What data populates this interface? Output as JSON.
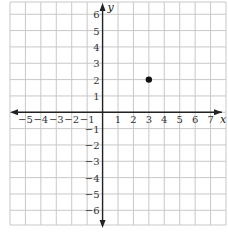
{
  "chart_data": {
    "type": "scatter",
    "title": "",
    "xlabel": "x",
    "ylabel": "y",
    "xlim": [
      -6,
      8
    ],
    "ylim": [
      -6.9,
      6.75
    ],
    "grid": true,
    "legend": null,
    "x_ticks": [
      -5,
      -4,
      -3,
      -2,
      -1,
      1,
      2,
      3,
      4,
      5,
      6,
      7
    ],
    "y_ticks": [
      6,
      5,
      4,
      3,
      2,
      1,
      -1,
      -2,
      -3,
      -4,
      -5,
      -6
    ],
    "series": [
      {
        "name": "point",
        "points": [
          {
            "x": 3,
            "y": 2
          }
        ]
      }
    ]
  },
  "style": {
    "grid_color": "#c8c8c8",
    "axis_color": "#222222",
    "point_color": "#111111"
  }
}
